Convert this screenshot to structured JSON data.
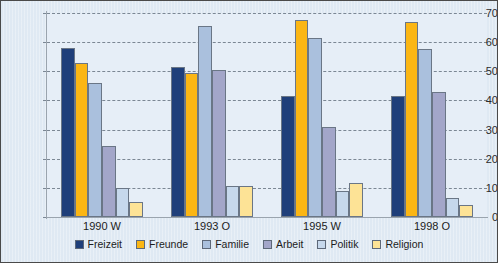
{
  "chart_data": {
    "type": "bar",
    "title": "",
    "subtitle": "",
    "xlabel": "",
    "ylabel": "",
    "categories": [
      "1990 W",
      "1993 O",
      "1995 W",
      "1998 O"
    ],
    "series": [
      {
        "name": "Freizeit",
        "color": "#1f3f7a",
        "values": [
          58,
          51.5,
          41.5,
          41.5
        ]
      },
      {
        "name": "Freunde",
        "color": "#fbb614",
        "values": [
          53,
          49.5,
          67.5,
          67
        ]
      },
      {
        "name": "Familie",
        "color": "#aac0dd",
        "values": [
          46,
          65.5,
          61.5,
          57.5
        ]
      },
      {
        "name": "Arbeit",
        "color": "#a3a6c9",
        "values": [
          24.5,
          50.5,
          31,
          43
        ]
      },
      {
        "name": "Politik",
        "color": "#c6d8ec",
        "values": [
          10,
          10.5,
          9,
          6.5
        ]
      },
      {
        "name": "Religion",
        "color": "#fde396",
        "values": [
          5,
          10.5,
          11.5,
          4
        ]
      }
    ],
    "ylim": [
      0,
      70
    ],
    "yticks": [
      0,
      10,
      20,
      30,
      40,
      50,
      60,
      70
    ],
    "ytick_labels": [
      "0",
      "10",
      "20",
      "30",
      "40",
      "50",
      "60",
      "70"
    ],
    "grid": true,
    "grid_style": "dashed-horizontal",
    "legend_position": "bottom-center",
    "legend_entries": [
      "Freizeit",
      "Freunde",
      "Familie",
      "Arbeit",
      "Politik",
      "Religion"
    ],
    "plot_background": "#e6eef7",
    "figure_background": "#dfe9f3",
    "border_color": "#4a4a4a"
  }
}
